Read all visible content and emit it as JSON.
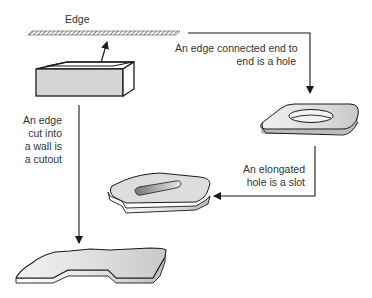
{
  "diagram": {
    "title": "",
    "nodes": [
      {
        "id": "edge",
        "label": "Edge",
        "shape": "hatched-bar"
      },
      {
        "id": "box",
        "label": "",
        "shape": "open-box"
      },
      {
        "id": "hole",
        "label": "",
        "shape": "plate-with-hole"
      },
      {
        "id": "slot",
        "label": "",
        "shape": "plate-with-slot"
      },
      {
        "id": "cutout",
        "label": "",
        "shape": "plate-with-cutout"
      }
    ],
    "edges": [
      {
        "from": "box",
        "to": "edge",
        "label": ""
      },
      {
        "from": "edge",
        "to": "hole",
        "label": "An edge connected end to end is a hole"
      },
      {
        "from": "hole",
        "to": "slot",
        "label": "An elongated hole is a slot"
      },
      {
        "from": "box",
        "to": "cutout",
        "label": "An edge cut into a wall is a cutout"
      }
    ]
  },
  "labels": {
    "edge": "Edge",
    "hole_line1": "An edge connected end to",
    "hole_line2": "end is a hole",
    "slot_line1": "An elongated",
    "slot_line2": "hole is a slot",
    "cutout_line1": "An edge",
    "cutout_line2": "cut into",
    "cutout_line3": "a wall is",
    "cutout_line4": "a cutout"
  },
  "colors": {
    "line": "#1a1a1a",
    "fill_gray": "#d4d4d4",
    "text": "#333333"
  }
}
